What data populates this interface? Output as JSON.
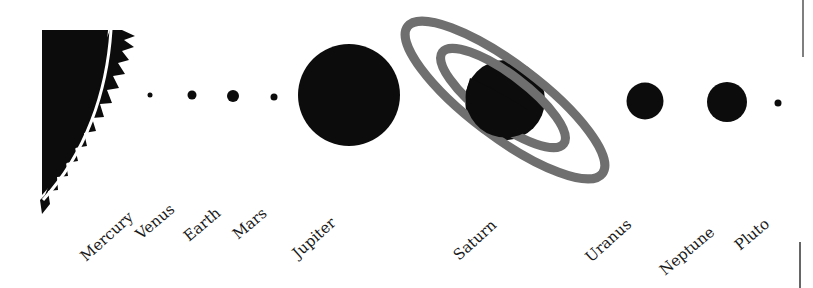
{
  "diagram": {
    "title": "",
    "colors": {
      "planet": "#0c0c0c",
      "ring": "#6f6f6f",
      "sun": "#0c0c0c",
      "background": "#ffffff",
      "divider": "#555555"
    },
    "sun": {
      "name": "Sun"
    },
    "planets": [
      {
        "name": "Mercury",
        "cx": 150,
        "cy": 95,
        "r": 2.5
      },
      {
        "name": "Venus",
        "cx": 192,
        "cy": 95,
        "r": 4.5
      },
      {
        "name": "Earth",
        "cx": 233,
        "cy": 96,
        "r": 6
      },
      {
        "name": "Mars",
        "cx": 274,
        "cy": 97,
        "r": 3.5
      },
      {
        "name": "Jupiter",
        "cx": 349,
        "cy": 95,
        "r": 51
      },
      {
        "name": "Saturn",
        "cx": 505,
        "cy": 100,
        "r": 40
      },
      {
        "name": "Uranus",
        "cx": 645,
        "cy": 101,
        "r": 18.5
      },
      {
        "name": "Neptune",
        "cx": 727,
        "cy": 102,
        "r": 20
      },
      {
        "name": "Pluto",
        "cx": 778,
        "cy": 103,
        "r": 3.5
      }
    ],
    "labels": {
      "mercury": "Mercury",
      "venus": "Venus",
      "earth": "Earth",
      "mars": "Mars",
      "jupiter": "Jupiter",
      "saturn": "Saturn",
      "uranus": "Uranus",
      "neptune": "Neptune",
      "pluto": "Pluto"
    }
  }
}
